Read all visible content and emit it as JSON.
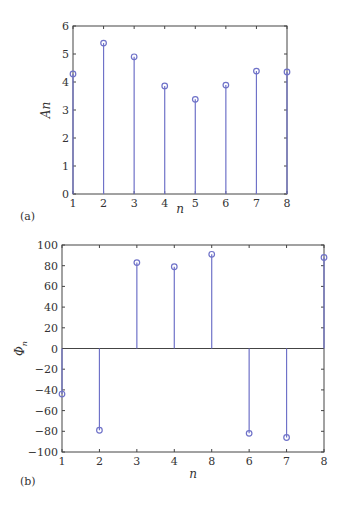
{
  "colors": {
    "stem": "#6f72c8",
    "axis": "#444444",
    "text": "#333333",
    "highlight_tick": "#b04a4a"
  },
  "chart_data": [
    {
      "type": "stem",
      "panel_label": "(a)",
      "title": "",
      "xlabel": "n",
      "ylabel": "An",
      "xlim": [
        1,
        8
      ],
      "ylim": [
        0,
        6
      ],
      "x_ticks": [
        "1",
        "2",
        "3",
        "4",
        "5",
        "6",
        "7",
        "8"
      ],
      "y_ticks": [
        "0",
        "1",
        "2",
        "3",
        "4",
        "5",
        "6"
      ],
      "grid": false,
      "x": [
        1,
        2,
        3,
        4,
        5,
        6,
        7,
        8
      ],
      "values": [
        4.29,
        5.39,
        4.9,
        3.86,
        3.38,
        3.89,
        4.39,
        4.36
      ]
    },
    {
      "type": "stem",
      "panel_label": "(b)",
      "title": "",
      "xlabel": "n",
      "ylabel": "Φn",
      "xlim": [
        1,
        8
      ],
      "ylim": [
        -100,
        100
      ],
      "x_ticks": [
        "1",
        "2",
        "3",
        "4",
        "8",
        "6",
        "7",
        "8"
      ],
      "y_ticks": [
        "−100",
        "−80",
        "−60",
        "−40",
        "−20",
        "0",
        "20",
        "40",
        "60",
        "80",
        "100"
      ],
      "grid": false,
      "zero_line": true,
      "x": [
        1,
        2,
        3,
        4,
        5,
        6,
        7,
        8
      ],
      "values": [
        -44,
        -79,
        83,
        79,
        91,
        -82,
        -86,
        88
      ]
    }
  ]
}
